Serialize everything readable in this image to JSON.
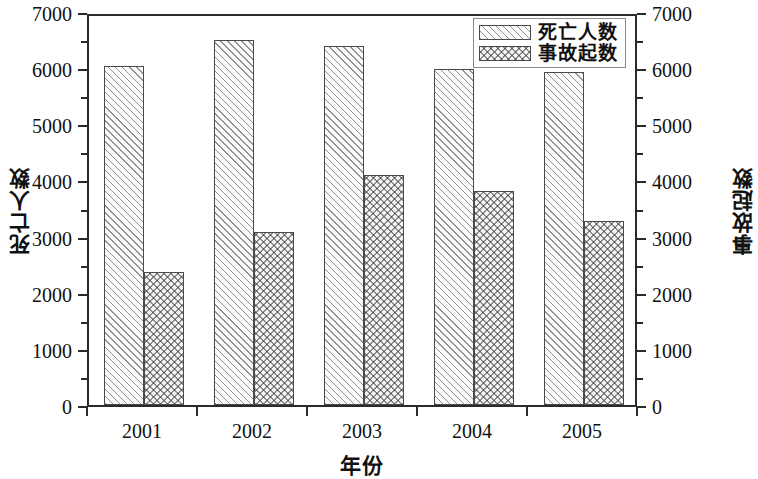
{
  "chart_data": {
    "type": "bar",
    "title": "",
    "xlabel": "年份",
    "ylabel": "死亡人数",
    "y2label": "事故起数",
    "categories": [
      "2001",
      "2002",
      "2003",
      "2004",
      "2005"
    ],
    "series": [
      {
        "name": "死亡人数",
        "axis": "left",
        "pattern": "diagonal-hatch",
        "values": [
          6040,
          6500,
          6400,
          5980,
          5940
        ]
      },
      {
        "name": "事故起数",
        "axis": "right",
        "pattern": "cross-hatch",
        "values": [
          2370,
          3080,
          4100,
          3820,
          3280
        ]
      }
    ],
    "ylim": [
      0,
      7000
    ],
    "y2lim": [
      0,
      7000
    ],
    "ytick_labels": [
      "0",
      "1000",
      "2000",
      "3000",
      "4000",
      "5000",
      "6000",
      "7000"
    ],
    "ytick_values": [
      0,
      1000,
      2000,
      3000,
      4000,
      5000,
      6000,
      7000
    ],
    "y2tick_labels": [
      "0",
      "1000",
      "2000",
      "3000",
      "4000",
      "5000",
      "6000",
      "7000"
    ],
    "y2tick_values": [
      0,
      1000,
      2000,
      3000,
      4000,
      5000,
      6000,
      7000
    ],
    "minor_ticks": true,
    "minor_tick_interval": 500,
    "grid": false,
    "legend_position": "top-right-inside",
    "legend_entries": [
      "死亡人数",
      "事故起数"
    ],
    "frame": "box",
    "colors": {
      "axis": "#2b2b2b",
      "bar_outline": "#4a4a4a",
      "hatch": "#3c3c3c",
      "background": "#ffffff",
      "text": "#111111"
    }
  }
}
